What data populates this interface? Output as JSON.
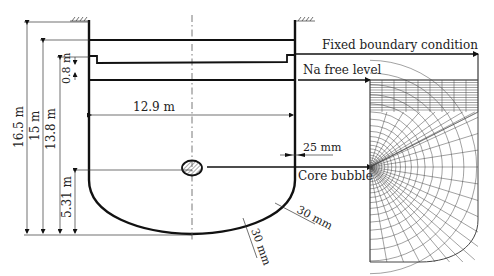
{
  "diagram": {
    "colors": {
      "line": "#111111",
      "thin": "#333333",
      "mesh": "#444444"
    },
    "labels": {
      "fixed_boundary": "Fixed boundary condition",
      "na_free_level": "Na free level",
      "core_bubble": "Core bubble",
      "width": "12.9 m",
      "wall_thickness": "25 mm",
      "bottom_thickness_1": "30 mm",
      "bottom_thickness_2": "30 mm"
    },
    "dimensions": [
      {
        "id": "dim-16-5",
        "label": "16.5 m"
      },
      {
        "id": "dim-15",
        "label": "15 m"
      },
      {
        "id": "dim-13-8",
        "label": "13.8 m"
      },
      {
        "id": "dim-0-8",
        "label": "0.8 m"
      },
      {
        "id": "dim-5-31",
        "label": "5.31 m"
      }
    ]
  }
}
